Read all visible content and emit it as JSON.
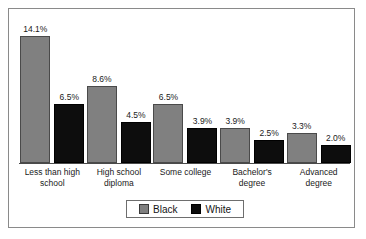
{
  "chart_data": {
    "type": "bar",
    "title": "",
    "subtitle": "",
    "xlabel": "",
    "ylabel": "",
    "ylim": [
      0,
      14.1
    ],
    "grid": false,
    "legend_position": "bottom",
    "value_suffix": "%",
    "categories": [
      "Less than high school",
      "High school diploma",
      "Some college",
      "Bachelor's degree",
      "Advanced degree"
    ],
    "category_lines": [
      [
        "Less than high",
        "school"
      ],
      [
        "High school",
        "diploma"
      ],
      [
        "Some college",
        ""
      ],
      [
        "Bachelor's",
        "degree"
      ],
      [
        "Advanced",
        "degree"
      ]
    ],
    "series": [
      {
        "name": "Black",
        "color": "#808080",
        "values": [
          14.1,
          8.6,
          6.5,
          3.9,
          3.3
        ],
        "labels": [
          "14.1%",
          "8.6%",
          "6.5%",
          "3.9%",
          "3.3%"
        ]
      },
      {
        "name": "White",
        "color": "#0d0d0d",
        "values": [
          6.5,
          4.5,
          3.9,
          2.5,
          2.0
        ],
        "labels": [
          "6.5%",
          "4.5%",
          "3.9%",
          "2.5%",
          "2.0%"
        ]
      }
    ]
  },
  "legend": {
    "items": [
      {
        "label": "Black",
        "swatch": "series-black"
      },
      {
        "label": "White",
        "swatch": "series-white"
      }
    ]
  },
  "colors": {
    "series_black": "#808080",
    "series_white": "#0d0d0d",
    "frame_border": "#8a8a8a",
    "axis": "#4a4a4a",
    "background": "#ffffff",
    "text": "#1a1a1a"
  }
}
